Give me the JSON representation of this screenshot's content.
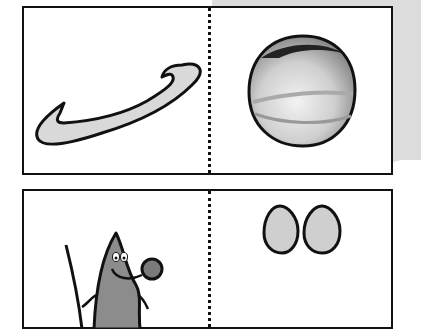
{
  "worksheet": {
    "background_accent_color": "#dcdcdc",
    "cards": [
      {
        "id": "card-1",
        "left_picture": {
          "subject": "ring",
          "fill": "#d9d9d9"
        },
        "right_picture": {
          "subject": "planet",
          "fill": "#c8c8c8"
        }
      },
      {
        "id": "card-2",
        "left_picture": {
          "subject": "mouse",
          "fill": "#8c8c8c"
        },
        "right_picture": {
          "subject": "eggs",
          "fill": "#cfcfcf"
        }
      }
    ]
  }
}
